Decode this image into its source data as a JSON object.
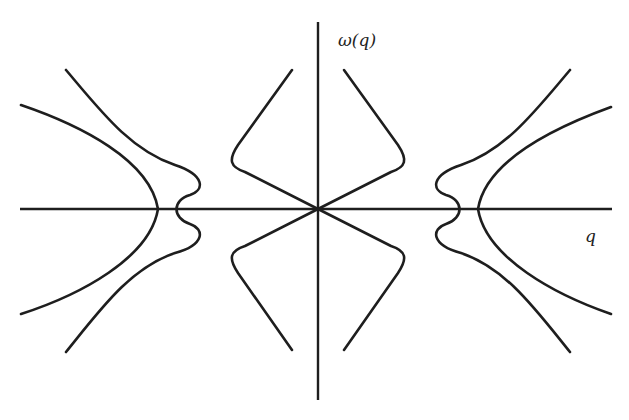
{
  "figure": {
    "type": "dispersion-relation-diagram",
    "axes": {
      "x_label": "q",
      "y_label": "ω(q)",
      "origin": [
        318,
        209
      ],
      "x_axis": {
        "from": [
          20,
          209
        ],
        "to": [
          612,
          209
        ]
      },
      "y_axis": {
        "from": [
          318,
          22
        ],
        "to": [
          318,
          400
        ]
      }
    },
    "colors": {
      "stroke": "#1e1e1e",
      "background": "#ffffff"
    },
    "curves": [
      {
        "name": "left-outer-branch",
        "d": "M21,105 C80,125 150,160 158,209 C150,258 80,295 21,314"
      },
      {
        "name": "left-inner-branch",
        "d": "M66,70 C100,110 130,150 175,165 C205,175 205,190 190,195 C172,200 172,218 190,224 C205,229 205,245 175,253 C130,268 100,310 66,352"
      },
      {
        "name": "center-left-upper",
        "d": "M292,70 L238,145 C228,160 230,167 245,172 L318,209"
      },
      {
        "name": "center-right-upper",
        "d": "M344,70 L398,145 C408,160 406,167 391,172 L318,209"
      },
      {
        "name": "center-left-lower",
        "d": "M292,350 L238,273 C228,258 230,251 245,246 L318,209"
      },
      {
        "name": "center-right-lower",
        "d": "M344,350 L398,273 C408,258 406,251 391,246 L318,209"
      },
      {
        "name": "right-inner-branch",
        "d": "M570,70 C536,110 506,150 461,165 C431,175 431,190 446,195 C464,200 464,218 446,224 C431,229 431,245 461,253 C506,268 536,310 570,352"
      },
      {
        "name": "right-outer-branch",
        "d": "M611,107 C556,127 486,160 478,209 C486,258 556,295 611,314"
      }
    ]
  }
}
